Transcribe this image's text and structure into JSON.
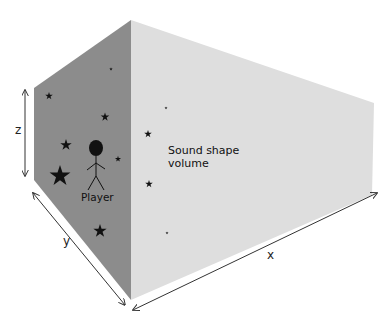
{
  "diagram": {
    "colors": {
      "left_face": "#8c8c8c",
      "right_face": "#dedede",
      "stars": "#111111",
      "arrows": "#333333"
    },
    "labels": {
      "z_axis": "z",
      "y_axis": "y",
      "x_axis": "x",
      "volume_line1": "Sound shape",
      "volume_line2": "volume",
      "player": "Player"
    }
  }
}
